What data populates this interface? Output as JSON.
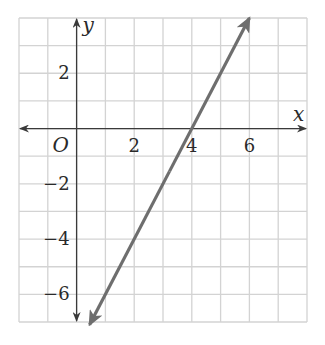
{
  "chart_data": {
    "type": "line",
    "title": "",
    "xlabel": "x",
    "ylabel": "y",
    "origin_label": "O",
    "xlim": [
      -2,
      8
    ],
    "ylim": [
      -7,
      4
    ],
    "grid": true,
    "grid_step": 1,
    "x_ticks": [
      {
        "value": 2,
        "label": "2"
      },
      {
        "value": 4,
        "label": "4"
      },
      {
        "value": 6,
        "label": "6"
      }
    ],
    "y_ticks": [
      {
        "value": 2,
        "label": "2"
      },
      {
        "value": -2,
        "label": "−2"
      },
      {
        "value": -4,
        "label": "−4"
      },
      {
        "value": -6,
        "label": "−6"
      }
    ],
    "series": [
      {
        "name": "line",
        "equation": "y = 2x - 8",
        "slope": 2,
        "intercept": -8,
        "x": [
          0.45,
          6
        ],
        "y": [
          -7.1,
          4
        ],
        "color": "#6e6e6e",
        "arrows": "both"
      }
    ]
  }
}
